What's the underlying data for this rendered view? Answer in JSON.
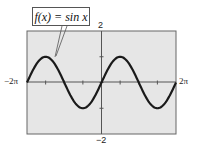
{
  "chart_data": {
    "type": "line",
    "title": "",
    "function_label": "f(x) = sin x",
    "xlabel": "",
    "ylabel": "",
    "xlim": [
      -6.2832,
      6.2832
    ],
    "ylim": [
      -2,
      2
    ],
    "x_tick_labels": {
      "left": "−2π",
      "right": "2π"
    },
    "y_tick_labels": {
      "top": "2",
      "bottom": "−2"
    },
    "x_tick_step": 1.5708,
    "y_tick_step": 1,
    "grid": false,
    "series": [
      {
        "name": "f(x) = sin x",
        "x": [
          -6.2832,
          -4.7124,
          -3.1416,
          -1.5708,
          0,
          1.5708,
          3.1416,
          4.7124,
          6.2832
        ],
        "values": [
          0,
          1,
          0,
          -1,
          0,
          1,
          0,
          -1,
          0
        ]
      }
    ],
    "colors": {
      "background": "#e6e6e6",
      "curve": "#1a1a1a",
      "axes": "#555555"
    }
  }
}
